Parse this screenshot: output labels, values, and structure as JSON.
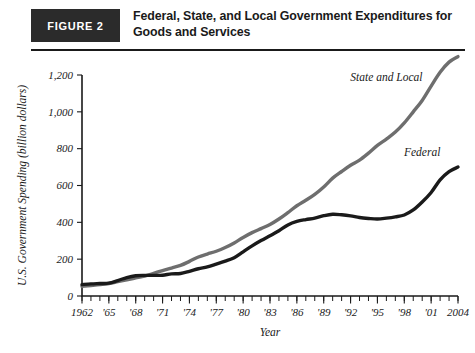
{
  "figure": {
    "badge_label": "FIGURE 2",
    "title": "Federal, State, and Local Government Expenditures for Goods and Services"
  },
  "chart_data": {
    "type": "line",
    "title": "Federal, State, and Local Government Expenditures for Goods and Services",
    "xlabel": "Year",
    "ylabel": "U.S. Government Spending (billion dollars)",
    "xlim": [
      1962,
      2004
    ],
    "ylim": [
      0,
      1200
    ],
    "yticks": [
      0,
      200,
      400,
      600,
      800,
      1000,
      1200
    ],
    "ytick_labels": [
      "0",
      "200",
      "400",
      "600",
      "800",
      "1,000",
      "1,200"
    ],
    "xticks": [
      1962,
      1965,
      1968,
      1971,
      1974,
      1977,
      1980,
      1983,
      1986,
      1989,
      1992,
      1995,
      1998,
      2001,
      2004
    ],
    "xtick_labels": [
      "1962",
      "'65",
      "'68",
      "'71",
      "'74",
      "'77",
      "'80",
      "'83",
      "'86",
      "'89",
      "'92",
      "'95",
      "'98",
      "'01",
      "2004"
    ],
    "minor_tick_every": 1,
    "grid": false,
    "legend_position": "inline-annotation",
    "x": [
      1962,
      1963,
      1964,
      1965,
      1966,
      1967,
      1968,
      1969,
      1970,
      1971,
      1972,
      1973,
      1974,
      1975,
      1976,
      1977,
      1978,
      1979,
      1980,
      1981,
      1982,
      1983,
      1984,
      1985,
      1986,
      1987,
      1988,
      1989,
      1990,
      1991,
      1992,
      1993,
      1994,
      1995,
      1996,
      1997,
      1998,
      1999,
      2000,
      2001,
      2002,
      2003,
      2004
    ],
    "series": [
      {
        "name": "Federal",
        "color": "#1a1a1a",
        "label_x": 2000,
        "label_y": 760,
        "values": [
          62,
          66,
          68,
          70,
          84,
          100,
          110,
          112,
          112,
          113,
          120,
          122,
          134,
          148,
          158,
          173,
          189,
          208,
          240,
          272,
          301,
          327,
          354,
          386,
          405,
          415,
          423,
          436,
          444,
          441,
          435,
          426,
          421,
          418,
          423,
          430,
          440,
          467,
          510,
          562,
          630,
          675,
          700
        ]
      },
      {
        "name": "State and Local",
        "color": "#6e6e6e",
        "label_x": 1996,
        "label_y": 1170,
        "values": [
          52,
          57,
          62,
          68,
          78,
          88,
          98,
          108,
          123,
          138,
          152,
          166,
          188,
          212,
          228,
          243,
          263,
          288,
          318,
          344,
          366,
          388,
          418,
          453,
          490,
          520,
          552,
          592,
          640,
          676,
          710,
          738,
          776,
          818,
          852,
          890,
          940,
          1000,
          1062,
          1140,
          1215,
          1270,
          1300
        ]
      }
    ]
  }
}
